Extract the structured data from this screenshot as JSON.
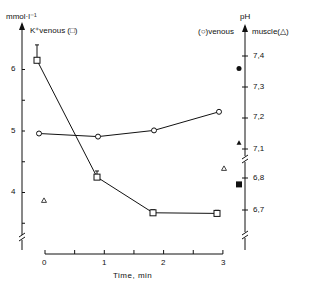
{
  "chart_data": {
    "type": "line",
    "title": "",
    "xlabel": "Time, min",
    "x_ticks": [
      "0",
      "1",
      "2",
      "3"
    ],
    "xlim": [
      0,
      3
    ],
    "left_axis": {
      "unit_label": "mmol·l⁻¹",
      "series_label": "K⁺venous (□)",
      "ticks": [
        "4",
        "5",
        "6"
      ],
      "ylim": [
        3.3,
        6.6
      ]
    },
    "right_axis": {
      "unit_label": "pH",
      "label_left": "(○)venous",
      "label_right": "muscle(△)",
      "ticks": [
        "7,4",
        "7,3",
        "7,2",
        "7,1",
        "6,8",
        "6,7"
      ],
      "axis_break_between": [
        "7,1",
        "6,8"
      ]
    },
    "series": [
      {
        "name": "K+ venous (□)",
        "axis": "left",
        "marker": "open-square",
        "x": [
          0.0,
          0.9,
          1.85,
          2.9
        ],
        "values": [
          6.15,
          4.25,
          3.67,
          3.66
        ],
        "error_upper": [
          0.25,
          0.1,
          0.05,
          0.05
        ]
      },
      {
        "name": "venous pH (○)",
        "axis": "right",
        "marker": "open-circle",
        "x": [
          0.0,
          0.9,
          1.85,
          2.95
        ],
        "values": [
          7.15,
          7.14,
          7.16,
          7.22
        ]
      },
      {
        "name": "muscle pH (△)",
        "axis": "right",
        "marker": "open-triangle",
        "x": [
          0.0,
          3.0
        ],
        "values": [
          6.73,
          6.83
        ]
      },
      {
        "name": "reference (filled)",
        "axis": "right",
        "marker": "filled",
        "points": [
          {
            "marker": "filled-circle",
            "value": 7.36
          },
          {
            "marker": "filled-triangle",
            "value": 7.12
          },
          {
            "marker": "filled-square",
            "value": 6.78
          }
        ]
      }
    ],
    "grid": false,
    "legend": "inline axis labels"
  }
}
